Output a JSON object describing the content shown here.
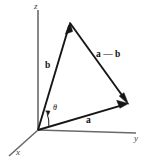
{
  "figure": {
    "type": "vector-diagram",
    "background_color": "#ffffff",
    "ink_color": "#161616",
    "axis_color": "#6a6a6a"
  },
  "axes": {
    "origin_label": "",
    "items": [
      {
        "id": "z",
        "label": "z",
        "name": "z-axis"
      },
      {
        "id": "y",
        "label": "y",
        "name": "y-axis"
      },
      {
        "id": "x",
        "label": "x",
        "name": "x-axis"
      }
    ]
  },
  "vectors": [
    {
      "id": "b",
      "label": "b",
      "name": "vector-b"
    },
    {
      "id": "a",
      "label": "a",
      "name": "vector-a"
    },
    {
      "id": "a_minus_b",
      "label": "a — b",
      "name": "vector-a-minus-b"
    }
  ],
  "angle": {
    "symbol": "θ",
    "name": "angle-theta-between-a-and-b"
  },
  "geometry": {
    "origin": [
      38,
      130
    ],
    "z_axis_end": [
      38,
      10
    ],
    "y_axis_end": [
      136,
      133
    ],
    "x_axis_end": [
      9,
      156
    ],
    "b_tip": [
      70,
      23
    ],
    "a_tip": [
      128,
      104
    ]
  }
}
